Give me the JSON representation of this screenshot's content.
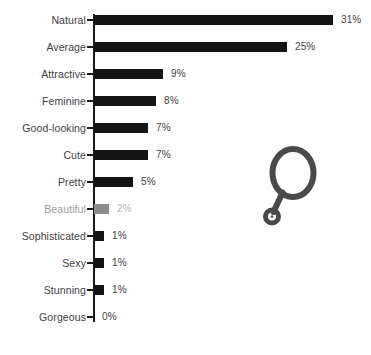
{
  "chart_data": {
    "type": "bar",
    "orientation": "horizontal",
    "title": "",
    "subtitle": "",
    "xlabel": "",
    "ylabel": "",
    "xlim": [
      0,
      31
    ],
    "grid": false,
    "legend": null,
    "value_suffix": "%",
    "categories": [
      "Natural",
      "Average",
      "Attractive",
      "Feminine",
      "Good-looking",
      "Cute",
      "Pretty",
      "Beautiful",
      "Sophisticated",
      "Sexy",
      "Stunning",
      "Gorgeous"
    ],
    "values": [
      31,
      25,
      9,
      8,
      7,
      7,
      5,
      2,
      1,
      1,
      1,
      0
    ],
    "value_labels": [
      "31%",
      "25%",
      "9%",
      "8%",
      "7%",
      "7%",
      "5%",
      "2%",
      "1%",
      "1%",
      "1%",
      "0%"
    ],
    "highlighted_category": "Beautiful",
    "colors": {
      "bar": "#141414",
      "bar_muted": "#8c8c8c",
      "label": "#3d3d3d",
      "label_muted": "#9a9a9a",
      "value_muted": "#b5b5b5",
      "axis": "#1a1a1a",
      "background": "#ffffff",
      "icon": "#4a4a4a"
    }
  },
  "decoration": {
    "icon_name": "hand-mirror-icon"
  }
}
